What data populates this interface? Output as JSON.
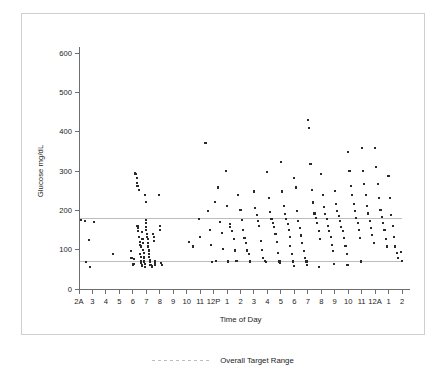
{
  "chart_data": {
    "type": "scatter",
    "title": "",
    "xlabel": "Time of Day",
    "ylabel": "Glucose mg/dL",
    "ylim": [
      0,
      600
    ],
    "yticks": [
      0,
      100,
      200,
      300,
      400,
      500,
      600
    ],
    "ytick_labels": [
      "0",
      "100",
      "200",
      "300",
      "400",
      "500",
      "600"
    ],
    "xtick_labels": [
      "2A",
      "3",
      "4",
      "5",
      "6",
      "7",
      "8",
      "9",
      "10",
      "11",
      "12P",
      "1",
      "2",
      "3",
      "4",
      "5",
      "6",
      "7",
      "8",
      "9",
      "10",
      "11",
      "12A",
      "1",
      "2"
    ],
    "xlim_hours": [
      2,
      26
    ],
    "grid": false,
    "legend_position": "bottom-center",
    "legend": [
      {
        "name": "Overall Target Range",
        "style": "dotted-line",
        "color": "#bdbdbd"
      }
    ],
    "annotations": [
      {
        "label": "Overall Target Range upper bound",
        "y": 180
      },
      {
        "label": "Overall Target Range lower bound",
        "y": 70
      }
    ],
    "target_range": {
      "low": 70,
      "high": 180
    },
    "marker": {
      "shape": "square",
      "color": "#2a2a2a",
      "size_px": 2.1
    },
    "series": [
      {
        "name": "Glucose readings",
        "points": [
          [
            2.15,
            175
          ],
          [
            2.45,
            172
          ],
          [
            2.5,
            68
          ],
          [
            2.75,
            125
          ],
          [
            2.85,
            57
          ],
          [
            3.1,
            170
          ],
          [
            4.5,
            88
          ],
          [
            5.85,
            96
          ],
          [
            6.0,
            60
          ],
          [
            6.05,
            63
          ],
          [
            6.15,
            295
          ],
          [
            6.2,
            292
          ],
          [
            6.3,
            283
          ],
          [
            6.35,
            160
          ],
          [
            6.4,
            155
          ],
          [
            6.4,
            148
          ],
          [
            6.45,
            132
          ],
          [
            6.5,
            120
          ],
          [
            6.55,
            112
          ],
          [
            6.55,
            88
          ],
          [
            6.6,
            82
          ],
          [
            6.6,
            72
          ],
          [
            6.62,
            66
          ],
          [
            6.65,
            60
          ],
          [
            6.68,
            58
          ],
          [
            6.3,
            270
          ],
          [
            6.35,
            262
          ],
          [
            6.45,
            252
          ],
          [
            6.7,
            144
          ],
          [
            6.72,
            127
          ],
          [
            6.75,
            118
          ],
          [
            6.78,
            100
          ],
          [
            6.8,
            92
          ],
          [
            6.82,
            80
          ],
          [
            6.85,
            70
          ],
          [
            6.88,
            64
          ],
          [
            6.9,
            57
          ],
          [
            6.95,
            175
          ],
          [
            6.98,
            168
          ],
          [
            7.0,
            158
          ],
          [
            7.0,
            150
          ],
          [
            7.05,
            140
          ],
          [
            7.05,
            133
          ],
          [
            7.1,
            128
          ],
          [
            7.12,
            118
          ],
          [
            7.15,
            108
          ],
          [
            7.18,
            98
          ],
          [
            7.2,
            90
          ],
          [
            7.22,
            82
          ],
          [
            7.25,
            74
          ],
          [
            7.28,
            68
          ],
          [
            7.3,
            62
          ],
          [
            7.35,
            60
          ],
          [
            7.4,
            58
          ],
          [
            7.42,
            56
          ],
          [
            6.9,
            238
          ],
          [
            6.95,
            222
          ],
          [
            7.5,
            140
          ],
          [
            7.55,
            132
          ],
          [
            7.6,
            122
          ],
          [
            7.62,
            72
          ],
          [
            7.65,
            66
          ],
          [
            7.68,
            60
          ],
          [
            7.95,
            240
          ],
          [
            8.0,
            160
          ],
          [
            8.05,
            150
          ],
          [
            8.1,
            66
          ],
          [
            8.15,
            60
          ],
          [
            6.6,
            108
          ],
          [
            6.1,
            76
          ],
          [
            5.9,
            78
          ],
          [
            10.2,
            120
          ],
          [
            10.5,
            108
          ],
          [
            10.9,
            178
          ],
          [
            11.0,
            132
          ],
          [
            11.4,
            372
          ],
          [
            11.6,
            198
          ],
          [
            11.7,
            150
          ],
          [
            11.8,
            112
          ],
          [
            12.1,
            222
          ],
          [
            12.3,
            258
          ],
          [
            12.5,
            170
          ],
          [
            12.6,
            142
          ],
          [
            12.7,
            102
          ],
          [
            12.9,
            300
          ],
          [
            13.0,
            212
          ],
          [
            13.2,
            165
          ],
          [
            13.25,
            158
          ],
          [
            13.4,
            148
          ],
          [
            13.5,
            128
          ],
          [
            13.6,
            98
          ],
          [
            13.8,
            238
          ],
          [
            14.0,
            200
          ],
          [
            14.1,
            175
          ],
          [
            14.2,
            150
          ],
          [
            14.3,
            130
          ],
          [
            14.4,
            118
          ],
          [
            14.5,
            98
          ],
          [
            14.6,
            88
          ],
          [
            15.0,
            248
          ],
          [
            15.1,
            205
          ],
          [
            15.2,
            188
          ],
          [
            15.3,
            172
          ],
          [
            15.4,
            160
          ],
          [
            15.5,
            122
          ],
          [
            15.6,
            100
          ],
          [
            15.7,
            78
          ],
          [
            15.8,
            72
          ],
          [
            16.0,
            298
          ],
          [
            16.1,
            232
          ],
          [
            16.2,
            196
          ],
          [
            16.3,
            178
          ],
          [
            16.4,
            168
          ],
          [
            16.5,
            158
          ],
          [
            16.6,
            140
          ],
          [
            16.7,
            120
          ],
          [
            16.8,
            92
          ],
          [
            16.9,
            70
          ],
          [
            17.0,
            322
          ],
          [
            17.1,
            248
          ],
          [
            17.2,
            210
          ],
          [
            17.3,
            190
          ],
          [
            17.4,
            178
          ],
          [
            17.5,
            165
          ],
          [
            17.6,
            150
          ],
          [
            17.65,
            132
          ],
          [
            17.7,
            110
          ],
          [
            17.8,
            88
          ],
          [
            17.9,
            70
          ],
          [
            18.0,
            282
          ],
          [
            18.1,
            258
          ],
          [
            18.2,
            198
          ],
          [
            18.3,
            172
          ],
          [
            18.4,
            155
          ],
          [
            18.5,
            136
          ],
          [
            18.6,
            116
          ],
          [
            18.7,
            96
          ],
          [
            18.8,
            78
          ],
          [
            18.9,
            70
          ],
          [
            19.0,
            430
          ],
          [
            19.1,
            410
          ],
          [
            19.2,
            318
          ],
          [
            19.3,
            252
          ],
          [
            19.4,
            220
          ],
          [
            19.5,
            192
          ],
          [
            19.6,
            180
          ],
          [
            19.7,
            168
          ],
          [
            19.8,
            148
          ],
          [
            19.9,
            128
          ],
          [
            20.0,
            292
          ],
          [
            20.1,
            240
          ],
          [
            20.2,
            208
          ],
          [
            20.3,
            190
          ],
          [
            20.4,
            178
          ],
          [
            20.5,
            160
          ],
          [
            20.6,
            148
          ],
          [
            20.7,
            132
          ],
          [
            20.8,
            112
          ],
          [
            20.9,
            96
          ],
          [
            21.0,
            250
          ],
          [
            21.1,
            215
          ],
          [
            21.2,
            198
          ],
          [
            21.3,
            185
          ],
          [
            21.4,
            172
          ],
          [
            21.5,
            158
          ],
          [
            21.6,
            148
          ],
          [
            21.7,
            130
          ],
          [
            21.8,
            110
          ],
          [
            21.9,
            90
          ],
          [
            22.0,
            348
          ],
          [
            22.1,
            300
          ],
          [
            22.2,
            262
          ],
          [
            22.3,
            240
          ],
          [
            22.4,
            215
          ],
          [
            22.5,
            198
          ],
          [
            22.6,
            180
          ],
          [
            22.7,
            168
          ],
          [
            22.8,
            150
          ],
          [
            22.9,
            130
          ],
          [
            23.0,
            358
          ],
          [
            23.1,
            300
          ],
          [
            23.2,
            268
          ],
          [
            23.3,
            238
          ],
          [
            23.4,
            210
          ],
          [
            23.5,
            192
          ],
          [
            23.6,
            172
          ],
          [
            23.7,
            155
          ],
          [
            23.8,
            138
          ],
          [
            23.9,
            118
          ],
          [
            24.0,
            358
          ],
          [
            24.1,
            310
          ],
          [
            24.2,
            268
          ],
          [
            24.3,
            232
          ],
          [
            24.4,
            200
          ],
          [
            24.5,
            182
          ],
          [
            24.6,
            168
          ],
          [
            24.7,
            150
          ],
          [
            24.8,
            128
          ],
          [
            24.9,
            108
          ],
          [
            25.0,
            288
          ],
          [
            25.1,
            232
          ],
          [
            25.2,
            188
          ],
          [
            25.3,
            160
          ],
          [
            25.4,
            132
          ],
          [
            25.5,
            108
          ],
          [
            25.6,
            92
          ],
          [
            25.7,
            78
          ],
          [
            26.0,
            72
          ],
          [
            25.95,
            95
          ],
          [
            13.1,
            70
          ],
          [
            13.7,
            72
          ],
          [
            14.7,
            70
          ],
          [
            15.9,
            68
          ],
          [
            16.95,
            66
          ],
          [
            18.95,
            62
          ],
          [
            20.95,
            64
          ],
          [
            22.95,
            70
          ],
          [
            12.2,
            72
          ],
          [
            11.9,
            68
          ],
          [
            19.85,
            55
          ],
          [
            17.95,
            58
          ],
          [
            21.95,
            60
          ]
        ]
      }
    ]
  },
  "legend_ui": {
    "label": "Overall Target Range"
  }
}
